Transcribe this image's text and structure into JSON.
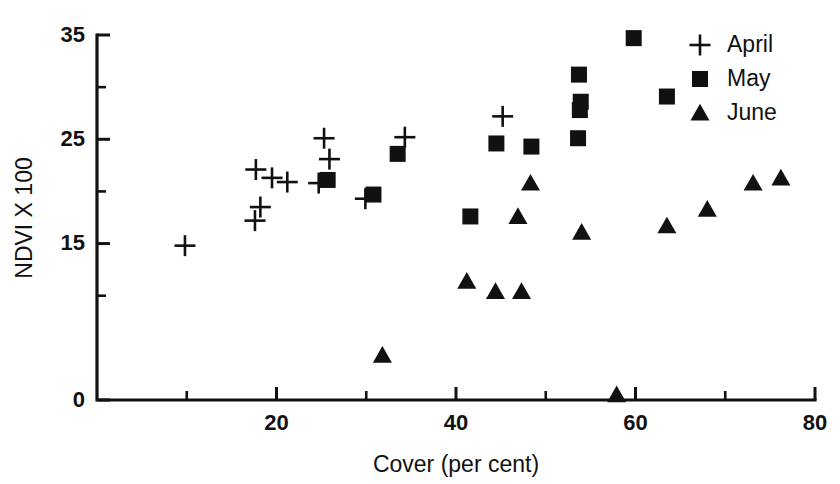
{
  "chart_data": {
    "type": "scatter",
    "title": "",
    "xlabel": "Cover (per cent)",
    "ylabel": "NDVI X 100",
    "xlim": [
      0,
      80
    ],
    "ylim": [
      0,
      35
    ],
    "grid": false,
    "legend_position": "top-right",
    "x_ticks_major": [
      20,
      40,
      60,
      80
    ],
    "x_ticks_minor": [
      10,
      30,
      50,
      70
    ],
    "x_tick_labels": [
      "20",
      "40",
      "60",
      "80"
    ],
    "y_ticks_major": [
      0,
      15,
      25,
      35
    ],
    "y_ticks_minor": [
      10,
      20,
      30
    ],
    "y_tick_labels": [
      "0",
      "15",
      "25",
      "35"
    ],
    "series": [
      {
        "name": "April",
        "marker": "plus",
        "points": [
          [
            9.8,
            14.8
          ],
          [
            17.6,
            17.2
          ],
          [
            17.7,
            22.1
          ],
          [
            18.2,
            18.5
          ],
          [
            19.5,
            21.3
          ],
          [
            21.2,
            20.9
          ],
          [
            24.7,
            20.8
          ],
          [
            25.3,
            25.1
          ],
          [
            25.9,
            23.1
          ],
          [
            29.9,
            19.3
          ],
          [
            34.3,
            25.2
          ],
          [
            45.2,
            27.2
          ]
        ]
      },
      {
        "name": "May",
        "marker": "square",
        "points": [
          [
            25.7,
            21.1
          ],
          [
            30.8,
            19.7
          ],
          [
            33.5,
            23.6
          ],
          [
            41.6,
            17.6
          ],
          [
            44.5,
            24.6
          ],
          [
            48.4,
            24.3
          ],
          [
            53.6,
            25.1
          ],
          [
            53.8,
            27.8
          ],
          [
            53.9,
            28.6
          ],
          [
            53.7,
            31.2
          ],
          [
            59.8,
            34.7
          ],
          [
            63.5,
            29.1
          ]
        ]
      },
      {
        "name": "June",
        "marker": "triangle",
        "points": [
          [
            31.8,
            4.3
          ],
          [
            41.2,
            11.4
          ],
          [
            44.4,
            10.4
          ],
          [
            47.3,
            10.4
          ],
          [
            46.9,
            17.6
          ],
          [
            48.3,
            20.8
          ],
          [
            54.0,
            16.1
          ],
          [
            57.9,
            0.5
          ],
          [
            63.5,
            16.7
          ],
          [
            68.0,
            18.3
          ],
          [
            73.1,
            20.8
          ],
          [
            76.2,
            21.3
          ]
        ]
      }
    ]
  },
  "legend": {
    "entries": [
      {
        "label": "April",
        "marker": "plus"
      },
      {
        "label": "May",
        "marker": "square"
      },
      {
        "label": "June",
        "marker": "triangle"
      }
    ]
  },
  "axes": {
    "x_title": "Cover (per cent)",
    "y_title": "NDVI X 100"
  }
}
